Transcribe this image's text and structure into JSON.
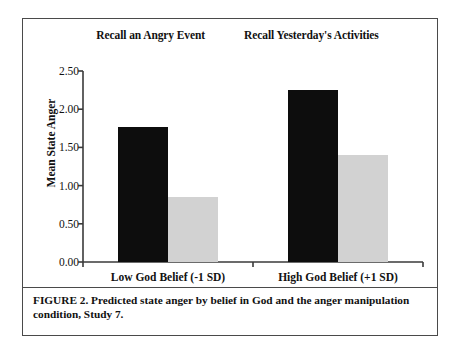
{
  "figure": {
    "caption": "FIGURE 2. Predicted state anger by belief in God and the anger manipulation condition, Study 7.",
    "frame_color": "#4a4a4a",
    "background": "#ffffff"
  },
  "chart_data": {
    "type": "bar",
    "title": "",
    "xlabel": "",
    "ylabel": "Mean State Anger",
    "categories": [
      "Low God Belief (-1 SD)",
      "High God Belief (+1 SD)"
    ],
    "series": [
      {
        "name": "Recall an Angry Event",
        "color": "#0d0d0d",
        "values": [
          1.77,
          2.25
        ]
      },
      {
        "name": "Recall Yesterday's Activities",
        "color": "#d2d2d2",
        "values": [
          0.85,
          1.4
        ]
      }
    ],
    "ylim": [
      0.0,
      2.5
    ],
    "ytick_values": [
      0.0,
      0.5,
      1.0,
      1.5,
      2.0,
      2.5
    ],
    "ytick_labels": [
      "0.00",
      "0.50",
      "1.00",
      "1.50",
      "2.00",
      "2.50"
    ],
    "grid": false,
    "legend_position": "top-center"
  }
}
